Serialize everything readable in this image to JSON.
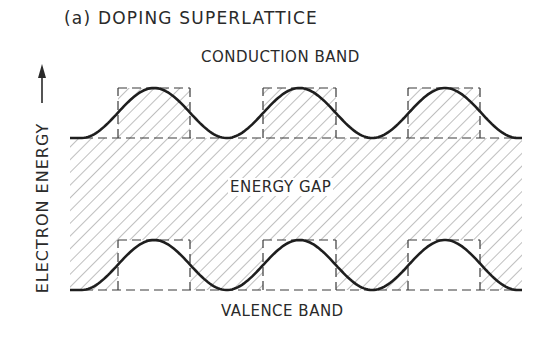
{
  "figure": {
    "title": "(a) DOPING SUPERLATTICE",
    "y_axis_label": "ELECTRON ENERGY",
    "y_axis_arrow": "arrow-up",
    "regions": {
      "conduction_band": "CONDUCTION BAND",
      "energy_gap": "ENERGY GAP",
      "valence_band": "VALENCE BAND"
    },
    "periods": 3,
    "colors": {
      "line": "#1e1e1e",
      "hatch": "#8a8a8a",
      "dashed_box": "#3a3a3a",
      "background": "#ffffff"
    },
    "geometry": {
      "x_start": 70,
      "x_end": 522,
      "conduction_high_y": 88,
      "conduction_low_y": 138,
      "valence_high_y": 240,
      "valence_low_y": 290,
      "box_x_ranges": [
        [
          118,
          190
        ],
        [
          263,
          336
        ],
        [
          408,
          480
        ]
      ]
    }
  }
}
